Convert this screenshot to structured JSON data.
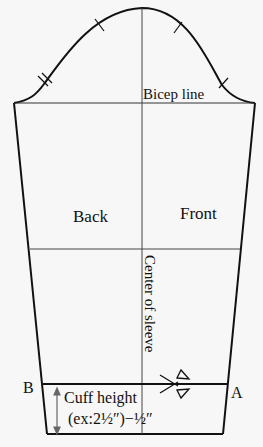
{
  "diagram": {
    "type": "sleeve-sewing-pattern",
    "colors": {
      "background": "#f7f7f7",
      "outline": "#111111",
      "guide": "#444444",
      "arrow": "#666666"
    },
    "labels": {
      "bicep_line": "Bicep line",
      "back": "Back",
      "front": "Front",
      "center_of_sleeve": "Center of sleeve",
      "point_b": "B",
      "point_a": "A",
      "cuff_height_line1": "Cuff height",
      "cuff_height_line2": "(ex:2½″)−½″"
    },
    "notches": {
      "back": 2,
      "front": 1,
      "cap_marks": 2
    },
    "icons": [
      "scissors-icon",
      "double-arrow-icon"
    ]
  }
}
